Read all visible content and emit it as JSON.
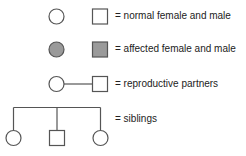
{
  "legend": {
    "title": "Pedigree symbol key",
    "colors": {
      "stroke": "#555555",
      "affected_fill": "#9a9a9a",
      "normal_fill": "#ffffff",
      "text": "#222222"
    },
    "rows": [
      {
        "id": "normal",
        "symbols": [
          "circle-open",
          "square-open"
        ],
        "label": "= normal female and male"
      },
      {
        "id": "affected",
        "symbols": [
          "circle-filled",
          "square-filled"
        ],
        "label": "= affected female and male"
      },
      {
        "id": "partners",
        "symbols": [
          "circle-open",
          "mating-line",
          "square-open"
        ],
        "label": "= reproductive partners"
      },
      {
        "id": "siblings",
        "symbols": [
          "sibship-line",
          "circle-open",
          "square-open",
          "circle-open"
        ],
        "label": "= siblings"
      }
    ]
  }
}
